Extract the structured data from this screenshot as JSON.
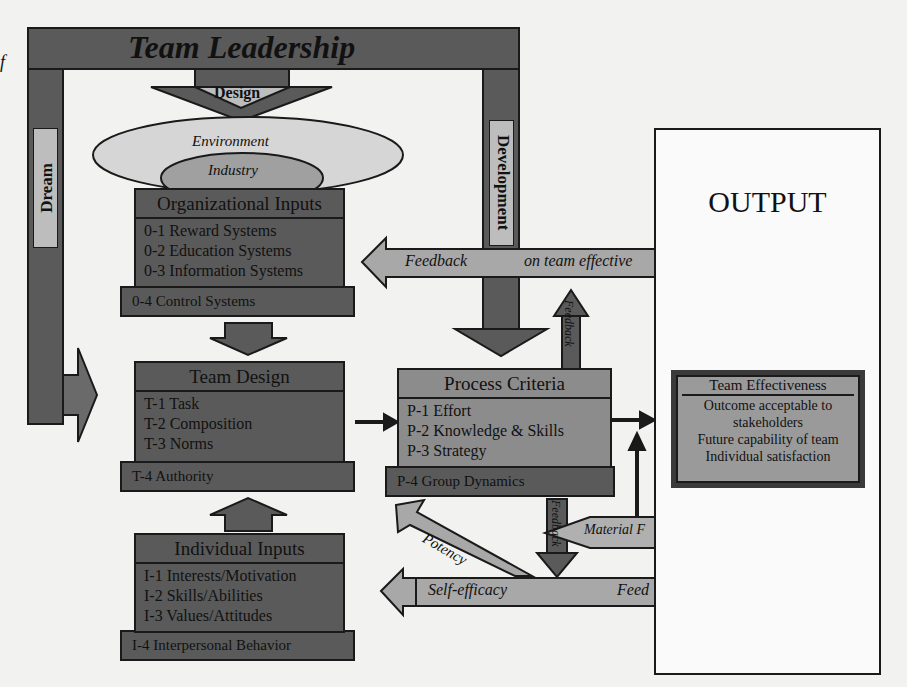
{
  "margin_fragment": "f",
  "leadership": {
    "title": "Team Leadership",
    "design_label": "Design",
    "dream_label": "Dream",
    "development_label": "Development"
  },
  "context": {
    "environment": "Environment",
    "industry": "Industry"
  },
  "organizational_inputs": {
    "title": "Organizational Inputs",
    "items": [
      "0-1 Reward Systems",
      "0-2 Education Systems",
      "0-3 Information Systems"
    ],
    "base": "0-4 Control Systems"
  },
  "team_design": {
    "title": "Team Design",
    "items": [
      "T-1 Task",
      "T-2 Composition",
      "T-3 Norms"
    ],
    "base": "T-4 Authority"
  },
  "individual_inputs": {
    "title": "Individual Inputs",
    "items": [
      "I-1 Interests/Motivation",
      "I-2 Skills/Abilities",
      "I-3 Values/Attitudes"
    ],
    "base": "I-4 Interpersonal Behavior"
  },
  "process_criteria": {
    "title": "Process Criteria",
    "items": [
      "P-1 Effort",
      "P-2 Knowledge & Skills",
      "P-3 Strategy"
    ],
    "base": "P-4 Group Dynamics"
  },
  "feedback_arrows": {
    "top_left": "Feedback",
    "top_right": "on team effective",
    "up_arrow": "Feedback",
    "down_arrow": "Feedback",
    "material": "Material F",
    "potency": "Potency",
    "self_efficacy": "Self-efficacy",
    "bottom_right": "Feed"
  },
  "output": {
    "title": "OUTPUT",
    "effectiveness": {
      "title": "Team Effectiveness",
      "items": [
        "Outcome acceptable to stakeholders",
        "Future capability of team",
        "Individual satisfaction"
      ]
    }
  },
  "colors": {
    "dark": "#5a5a5a",
    "mid": "#8c8c8c",
    "light": "#bdbdbd",
    "background": "#f2f2f0",
    "outline": "#1a1a1a"
  }
}
